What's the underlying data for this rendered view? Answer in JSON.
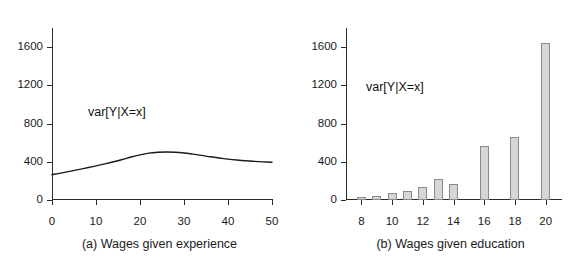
{
  "figure": {
    "background": "#ffffff",
    "axis_color": "#2b2b2b",
    "bar_fill": "#d6d6d6",
    "bar_stroke": "#8a8a8a",
    "curve_color": "#1a1a1a"
  },
  "panels": [
    {
      "id": "panel-a",
      "caption": "(a) Wages given experience",
      "annotation": "var[Y|X=x]"
    },
    {
      "id": "panel-b",
      "caption": "(b) Wages given education",
      "annotation": "var[Y|X=x]"
    }
  ],
  "chart_data": [
    {
      "type": "line",
      "title": "(a) Wages given experience",
      "xlabel": "",
      "ylabel": "",
      "xlim": [
        0,
        50
      ],
      "ylim": [
        0,
        1800
      ],
      "xticks": [
        0,
        10,
        20,
        30,
        40,
        50
      ],
      "yticks": [
        0,
        400,
        800,
        1200,
        1600
      ],
      "grid": false,
      "legend": "none",
      "annotations": [
        {
          "text": "var[Y|X=x]",
          "x": 27,
          "y": 640
        }
      ],
      "series": [
        {
          "name": "var[Y|X=x]",
          "x": [
            0,
            2,
            4,
            6,
            8,
            10,
            12,
            14,
            16,
            18,
            20,
            22,
            24,
            26,
            28,
            30,
            32,
            34,
            36,
            38,
            40,
            42,
            44,
            46,
            48,
            50
          ],
          "values": [
            265,
            281,
            299,
            318,
            337,
            357,
            378,
            400,
            424,
            450,
            472,
            490,
            500,
            503,
            500,
            492,
            480,
            467,
            452,
            440,
            428,
            418,
            410,
            404,
            399,
            395
          ]
        }
      ]
    },
    {
      "type": "bar",
      "title": "(b) Wages given education",
      "xlabel": "",
      "ylabel": "",
      "xlim": [
        7,
        21
      ],
      "ylim": [
        0,
        1800
      ],
      "xticks": [
        8,
        10,
        12,
        14,
        16,
        18,
        20
      ],
      "yticks": [
        0,
        400,
        800,
        1200,
        1600
      ],
      "grid": false,
      "legend": "none",
      "annotations": [
        {
          "text": "var[Y|X=x]",
          "x": 13.6,
          "y": 810
        }
      ],
      "categories": [
        8,
        9,
        10,
        11,
        12,
        13,
        14,
        16,
        18,
        20
      ],
      "values": [
        35,
        38,
        78,
        95,
        140,
        215,
        165,
        570,
        660,
        1640
      ],
      "series": [
        {
          "name": "var[Y|X=x]",
          "values": [
            35,
            38,
            78,
            95,
            140,
            215,
            165,
            570,
            660,
            1640
          ]
        }
      ]
    }
  ]
}
